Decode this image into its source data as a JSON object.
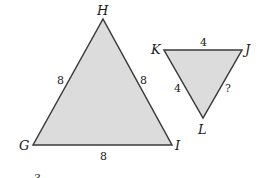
{
  "diagram": {
    "big_triangle": {
      "vertices": {
        "G": [
          33,
          145
        ],
        "H": [
          103,
          19
        ],
        "I": [
          172,
          145
        ]
      },
      "labels": {
        "G": "G",
        "H": "H",
        "I": "I"
      },
      "sides": {
        "GH": "8",
        "HI": "8",
        "GI": "8"
      },
      "fill": "#dcdcdc",
      "stroke": "#3a3a3a"
    },
    "small_triangle": {
      "vertices": {
        "K": [
          164,
          50
        ],
        "J": [
          242,
          50
        ],
        "L": [
          203,
          118
        ]
      },
      "labels": {
        "K": "K",
        "J": "J",
        "L": "L"
      },
      "sides": {
        "KJ": "4",
        "KL": "4",
        "JL": "?"
      },
      "fill": "#dcdcdc",
      "stroke": "#3a3a3a"
    },
    "fragment_text": "3"
  }
}
